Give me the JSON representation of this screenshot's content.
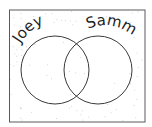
{
  "diagram": {
    "type": "venn",
    "sets": [
      {
        "name": "left-set",
        "label": "Joey"
      },
      {
        "name": "right-set",
        "label": "Sammy"
      }
    ],
    "colors": {
      "stroke": "#3a3a3a",
      "background": "#ffffff",
      "speckle": "#c8c8c8",
      "text": "#1e1e1e"
    }
  }
}
